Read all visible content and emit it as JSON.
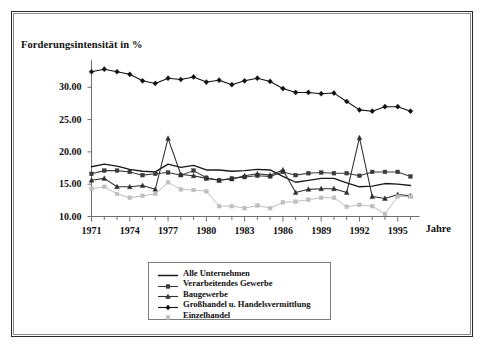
{
  "figure": {
    "title": "Forderungsintensität in %",
    "xaxis_title": "Jahre"
  },
  "chart_data": {
    "type": "line",
    "title": "Forderungsintensität in %",
    "xlabel": "Jahre",
    "ylabel": "Forderungsintensität in %",
    "xlim": [
      1971,
      1996
    ],
    "ylim": [
      10.0,
      33.5
    ],
    "yticks": [
      10.0,
      15.0,
      20.0,
      25.0,
      30.0
    ],
    "ytick_labels": [
      "10.00",
      "15.00",
      "20.00",
      "25.00",
      "30.00"
    ],
    "grid": false,
    "legend_position": "bottom-center",
    "x": [
      1971,
      1972,
      1973,
      1974,
      1975,
      1976,
      1977,
      1978,
      1979,
      1980,
      1981,
      1982,
      1983,
      1984,
      1985,
      1986,
      1987,
      1988,
      1989,
      1990,
      1991,
      1992,
      1993,
      1994,
      1995,
      1996
    ],
    "xtick_labels": [
      "1971",
      "1974",
      "1977",
      "1980",
      "1983",
      "1986",
      "1989",
      "1992",
      "1995"
    ],
    "xtick_values": [
      1971,
      1974,
      1977,
      1980,
      1983,
      1986,
      1989,
      1992,
      1995
    ],
    "series": [
      {
        "name": "Alle Unternehmen",
        "marker": "none",
        "color": "#1a1a1a",
        "values": [
          17.7,
          18.1,
          17.8,
          17.3,
          17.0,
          16.9,
          18.1,
          17.6,
          17.9,
          17.2,
          17.2,
          17.0,
          17.1,
          17.3,
          17.2,
          16.2,
          15.3,
          15.6,
          15.9,
          15.9,
          15.2,
          14.6,
          14.7,
          15.1,
          15.0,
          14.8
        ]
      },
      {
        "name": "Verarbeitendes Gewerbe",
        "marker": "square",
        "color": "#3c3c3c",
        "values": [
          16.6,
          17.1,
          17.1,
          16.9,
          16.4,
          16.6,
          16.8,
          16.4,
          17.1,
          16.0,
          15.6,
          15.9,
          16.1,
          16.3,
          16.2,
          16.9,
          16.4,
          16.7,
          16.8,
          16.7,
          16.7,
          16.3,
          16.9,
          16.9,
          16.9,
          16.2
        ]
      },
      {
        "name": "Baugewerbe",
        "marker": "triangle",
        "color": "#2e2e2e",
        "values": [
          15.6,
          15.9,
          14.6,
          14.6,
          14.8,
          14.2,
          22.1,
          16.5,
          16.3,
          15.9,
          15.6,
          15.8,
          16.3,
          16.6,
          16.4,
          17.2,
          13.7,
          14.2,
          14.3,
          14.3,
          13.7,
          22.2,
          13.1,
          12.8,
          13.4,
          13.2
        ]
      },
      {
        "name": "Großhandel u. Handelsvermittlung",
        "marker": "diamond",
        "color": "#111111",
        "values": [
          32.4,
          32.8,
          32.4,
          32.0,
          31.0,
          30.6,
          31.4,
          31.2,
          31.6,
          30.8,
          31.1,
          30.4,
          31.0,
          31.4,
          30.9,
          29.8,
          29.2,
          29.2,
          29.0,
          29.1,
          27.8,
          26.5,
          26.3,
          27.0,
          27.0,
          26.3
        ]
      },
      {
        "name": "Einzelhandel",
        "marker": "square",
        "color": "#bfbfbf",
        "values": [
          14.3,
          14.6,
          13.5,
          12.9,
          13.2,
          13.5,
          15.3,
          14.2,
          14.1,
          13.9,
          11.6,
          11.6,
          11.3,
          11.7,
          11.3,
          12.2,
          12.3,
          12.6,
          12.9,
          12.9,
          11.5,
          11.8,
          11.6,
          10.4,
          13.1,
          13.1
        ]
      }
    ]
  },
  "legend": {
    "items": [
      {
        "label": "Alle Unternehmen",
        "marker": "line",
        "color": "#1a1a1a"
      },
      {
        "label": "Verarbeitendes Gewerbe",
        "marker": "square",
        "color": "#3c3c3c"
      },
      {
        "label": "Baugewerbe",
        "marker": "triangle",
        "color": "#2e2e2e"
      },
      {
        "label": "Großhandel u. Handelsvermittlung",
        "marker": "diamond",
        "color": "#111111"
      },
      {
        "label": "Einzelhandel",
        "marker": "square",
        "color": "#bfbfbf"
      }
    ]
  }
}
